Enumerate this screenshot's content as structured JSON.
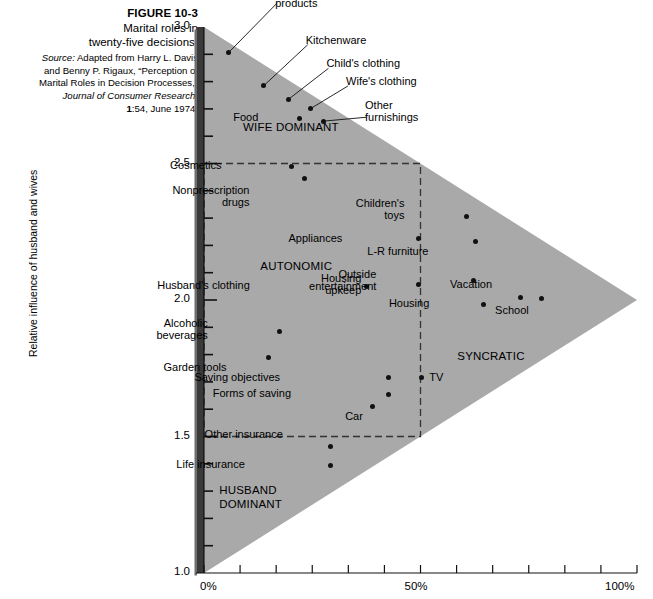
{
  "caption": {
    "figure_number": "FIGURE 10-3",
    "title_line1": "Marital roles in",
    "title_line2": "twenty-five decisions.",
    "source_word": "Source:",
    "source_line1": " Adapted from Harry L. Davis",
    "source_line2": "and Benny P. Rigaux, “Perception of",
    "source_line3": "Marital Roles in Decision Processes,”",
    "journal": "Journal of Consumer Research,",
    "volume": "1",
    "citation_tail": ":54, June 1974."
  },
  "chart_data": {
    "type": "scatter",
    "title": "Marital roles in twenty-five decisions.",
    "xlabel": "",
    "ylabel": "Relative influence of husband and wives",
    "xlim": [
      0,
      100
    ],
    "ylim": [
      1.0,
      3.0
    ],
    "x_tick_labels": [
      "0%",
      "50%",
      "100%"
    ],
    "x_tick_values": [
      0,
      50,
      100
    ],
    "x_minor_step": 8.333,
    "y_tick_labels": [
      "1.0",
      "1.5",
      "2.0",
      "2.5",
      "3.0"
    ],
    "y_tick_values": [
      1.0,
      1.5,
      2.0,
      2.5,
      3.0
    ],
    "y_minor_step": 0.1,
    "grid": false,
    "legend": "none",
    "colors": {
      "triangle_fill": "#a9a9a9",
      "point": "#111111",
      "axis": "#000000",
      "dashed_box": "#333333",
      "background": "#ffffff"
    },
    "annotations": [
      {
        "text": "WIFE DOMINANT",
        "x": 9.0,
        "y": 2.63
      },
      {
        "text": "AUTONOMIC",
        "x": 13.0,
        "y": 2.12
      },
      {
        "text": "SYNCRATIC",
        "x": 58.5,
        "y": 1.79
      },
      {
        "text": "HUSBAND\nDOMINANT",
        "x": 3.5,
        "y": 1.3
      }
    ],
    "region_box": {
      "x0": 0,
      "x1": 50,
      "y0": 1.5,
      "y1": 2.5,
      "style": "dashed"
    },
    "points": [
      {
        "label": "Cleaning\nproducts",
        "x": 5.6,
        "y": 2.905,
        "lx": 47,
        "ly": -68,
        "leader": true
      },
      {
        "label": "Kitchenware",
        "x": 13.8,
        "y": 2.785,
        "lx": 42,
        "ly": -52,
        "leader": true
      },
      {
        "label": "Child's clothing",
        "x": 19.5,
        "y": 2.735,
        "lx": 38,
        "ly": -42,
        "leader": true
      },
      {
        "label": "Wife's clothing",
        "x": 24.5,
        "y": 2.7,
        "lx": 36,
        "ly": -34,
        "leader": true
      },
      {
        "label": "Food",
        "x": 22.0,
        "y": 2.665,
        "lx": -41,
        "ly": -7,
        "leader": false
      },
      {
        "label": "Other\nfurnishings",
        "x": 27.5,
        "y": 2.655,
        "lx": 42,
        "ly": -22,
        "leader": true
      },
      {
        "label": "Cosmetics",
        "x": 20.2,
        "y": 2.49,
        "lx": -70,
        "ly": -7,
        "leader": false
      },
      {
        "label": "Nonprescription\ndrugs",
        "x": 23.2,
        "y": 2.445,
        "lx": -55,
        "ly": 5,
        "leader": false
      },
      {
        "label": "Children's\ntoys",
        "x": 60.6,
        "y": 2.305,
        "lx": -62,
        "ly": -20,
        "leader": false
      },
      {
        "label": "Appliances",
        "x": 49.5,
        "y": 2.225,
        "lx": -76,
        "ly": -7,
        "leader": false
      },
      {
        "label": "L-R furniture",
        "x": 62.7,
        "y": 2.215,
        "lx": -47,
        "ly": 4,
        "leader": false
      },
      {
        "label": "Housing\nupkeep",
        "x": 49.5,
        "y": 2.055,
        "lx": -57,
        "ly": -13,
        "leader": false
      },
      {
        "label": "Husband's clothing",
        "x": 37.6,
        "y": 2.05,
        "lx": -117,
        "ly": -7,
        "leader": false
      },
      {
        "label": "Outside\nentertainment",
        "x": 62.2,
        "y": 2.07,
        "lx": -97,
        "ly": -13,
        "leader": false
      },
      {
        "label": "Vacation",
        "x": 73.0,
        "y": 2.01,
        "lx": -28,
        "ly": -19,
        "leader": false
      },
      {
        "label": "School",
        "x": 78.0,
        "y": 2.005,
        "lx": -13,
        "ly": 5,
        "leader": false
      },
      {
        "label": "Housing",
        "x": 64.5,
        "y": 1.985,
        "lx": -54,
        "ly": -7,
        "leader": false
      },
      {
        "label": "Alcoholic\nbeverages",
        "x": 17.5,
        "y": 1.885,
        "lx": -72,
        "ly": -14,
        "leader": false
      },
      {
        "label": "Garden tools",
        "x": 14.9,
        "y": 1.79,
        "lx": -42,
        "ly": 4,
        "leader": false
      },
      {
        "label": "Saving objectives",
        "x": 42.5,
        "y": 1.715,
        "lx": -108,
        "ly": -7,
        "leader": false
      },
      {
        "label": "TV",
        "x": 50.2,
        "y": 1.715,
        "lx": 8,
        "ly": -7,
        "leader": false
      },
      {
        "label": "Forms of saving",
        "x": 42.5,
        "y": 1.655,
        "lx": -97,
        "ly": -7,
        "leader": false
      },
      {
        "label": "Car",
        "x": 39.0,
        "y": 1.61,
        "lx": -10,
        "ly": 4,
        "leader": false
      },
      {
        "label": "Other insurance",
        "x": 29.3,
        "y": 1.465,
        "lx": -48,
        "ly": -18,
        "leader": false
      },
      {
        "label": "Life insurance",
        "x": 29.3,
        "y": 1.395,
        "lx": -86,
        "ly": -7,
        "leader": false
      }
    ]
  }
}
